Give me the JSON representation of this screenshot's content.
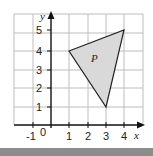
{
  "diagram": {
    "type": "coordinate-grid",
    "x_axis": {
      "label": "x",
      "min": -2,
      "max": 5,
      "tick_labels": [
        "-1",
        "0",
        "1",
        "2",
        "3",
        "4"
      ]
    },
    "y_axis": {
      "label": "y",
      "min": 0,
      "max": 6,
      "tick_labels": [
        "1",
        "2",
        "3",
        "4",
        "5"
      ]
    },
    "shape": {
      "name": "P",
      "vertices": [
        [
          1,
          4
        ],
        [
          4,
          5
        ],
        [
          3,
          1
        ]
      ],
      "fill": "#d9d9d9",
      "stroke": "#222222"
    },
    "colors": {
      "grid": "#bdbdbd",
      "axis": "#111111",
      "bottom_bar": "#8c8c8c"
    }
  }
}
